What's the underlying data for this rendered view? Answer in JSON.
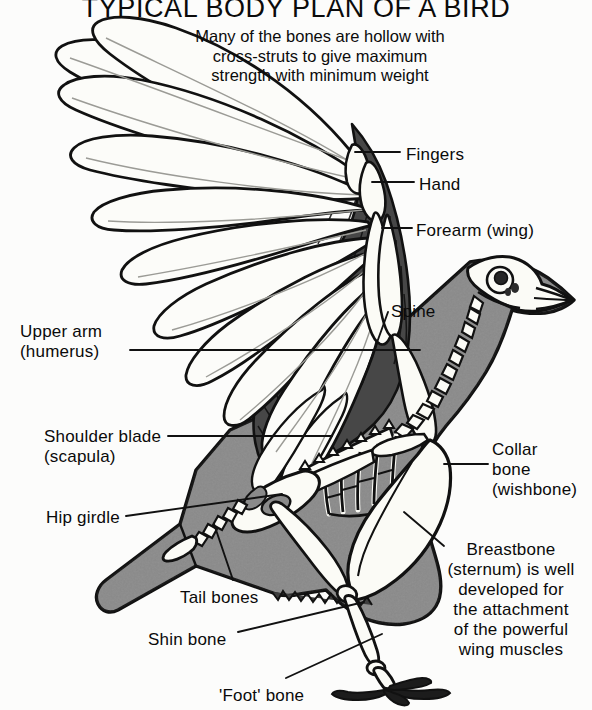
{
  "title": "TYPICAL BODY PLAN OF A BIRD",
  "intro": "Many of the bones are hollow with\ncross-struts to give maximum\nstrength with minimum weight",
  "colors": {
    "background": "#fcfcfb",
    "body_gray": "#8a8a8a",
    "dark_gray": "#4f4f4f",
    "outline": "#111111",
    "bone_white": "#fbfbf8",
    "text": "#0a0a0a"
  },
  "labels": [
    {
      "id": "fingers",
      "text": "Fingers",
      "x": 406,
      "y": 145,
      "align": "left"
    },
    {
      "id": "hand",
      "text": "Hand",
      "x": 419,
      "y": 175,
      "align": "left"
    },
    {
      "id": "forearm-wing",
      "text": "Forearm (wing)",
      "x": 416,
      "y": 221,
      "align": "left"
    },
    {
      "id": "spine",
      "text": "Spine",
      "x": 391,
      "y": 302,
      "align": "left"
    },
    {
      "id": "upper-arm",
      "text": "Upper arm\n(humerus)",
      "x": 20,
      "y": 322,
      "align": "left"
    },
    {
      "id": "shoulder-blade",
      "text": "Shoulder blade\n(scapula)",
      "x": 44,
      "y": 427,
      "align": "left"
    },
    {
      "id": "collar-bone",
      "text": "Collar\nbone\n(wishbone)",
      "x": 492,
      "y": 440,
      "align": "left"
    },
    {
      "id": "hip-girdle",
      "text": "Hip girdle",
      "x": 46,
      "y": 508,
      "align": "left"
    },
    {
      "id": "breastbone",
      "text": "Breastbone\n(sternum) is well\ndeveloped for\nthe attachment\nof the powerful\nwing muscles",
      "x": 447,
      "y": 540,
      "align": "left"
    },
    {
      "id": "tail-bones",
      "text": "Tail bones",
      "x": 180,
      "y": 588,
      "align": "left"
    },
    {
      "id": "shin-bone",
      "text": "Shin bone",
      "x": 148,
      "y": 630,
      "align": "left"
    },
    {
      "id": "foot-bone",
      "text": "'Foot' bone",
      "x": 219,
      "y": 686,
      "align": "left"
    }
  ],
  "diagram": {
    "parts": [
      "wing-feathers",
      "wing-bones",
      "skull",
      "spine",
      "ribcage",
      "collar-bone",
      "breastbone",
      "hip-girdle",
      "tail-bones",
      "thigh-bone",
      "shin-bone",
      "foot-bone",
      "claws",
      "body-silhouette"
    ]
  }
}
